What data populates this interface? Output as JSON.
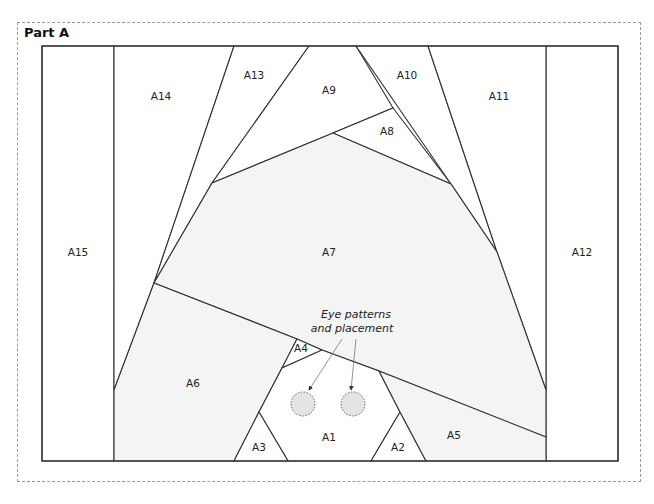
{
  "title": "Part A",
  "colors": {
    "line": "#333333",
    "shaded_fill": "#f4f4f4",
    "white_fill": "#ffffff",
    "eye_fill": "#e4e4e4",
    "dash_border": "#9a9a9a"
  },
  "annotation": {
    "line1": "Eye patterns",
    "line2": "and placement"
  },
  "sections": [
    {
      "id": "A1",
      "label": "A1"
    },
    {
      "id": "A2",
      "label": "A2"
    },
    {
      "id": "A3",
      "label": "A3"
    },
    {
      "id": "A4",
      "label": "A4"
    },
    {
      "id": "A5",
      "label": "A5"
    },
    {
      "id": "A6",
      "label": "A6"
    },
    {
      "id": "A7",
      "label": "A7"
    },
    {
      "id": "A8",
      "label": "A8"
    },
    {
      "id": "A9",
      "label": "A9"
    },
    {
      "id": "A10",
      "label": "A10"
    },
    {
      "id": "A11",
      "label": "A11"
    },
    {
      "id": "A12",
      "label": "A12"
    },
    {
      "id": "A13",
      "label": "A13"
    },
    {
      "id": "A14",
      "label": "A14"
    },
    {
      "id": "A15",
      "label": "A15"
    }
  ]
}
